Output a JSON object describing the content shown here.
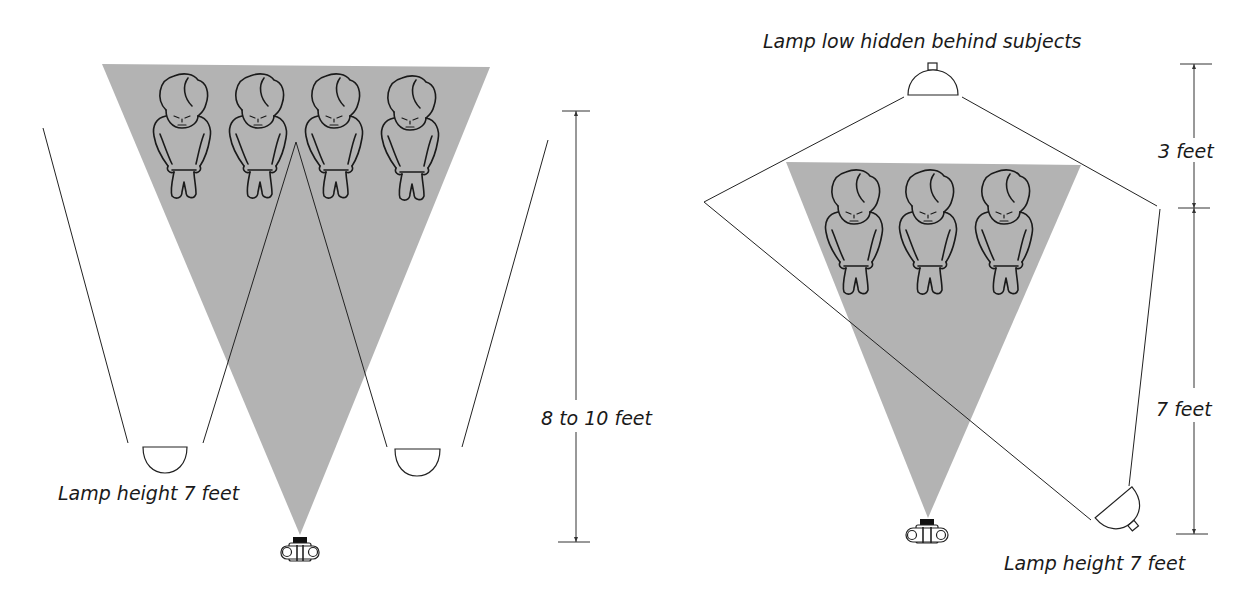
{
  "diagrams": [
    {
      "id": "left",
      "subject_count": 4,
      "labels": {
        "lamp_height": "Lamp height 7 feet",
        "distance": "8 to 10 feet"
      },
      "lamps": 2
    },
    {
      "id": "right",
      "subject_count": 3,
      "labels": {
        "top_lamp": "Lamp low hidden behind subjects",
        "upper_dimension": "3 feet",
        "lower_dimension": "7 feet",
        "lamp_height": "Lamp height 7 feet"
      },
      "lamps": 2
    }
  ],
  "colors": {
    "beam": "#b3b3b3",
    "line": "#222222",
    "background": "#ffffff"
  }
}
